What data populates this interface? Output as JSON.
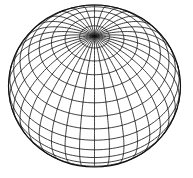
{
  "figure": {
    "type": "wireframe-sphere",
    "background": "#ffffff",
    "stroke_color": "#111111",
    "stroke_width": 0.8,
    "center": [
      94.5,
      86
    ],
    "radius_x": 86,
    "radius_y": 81,
    "tilt_deg": 52,
    "meridian_count": 36,
    "latitude_step_deg": 10
  }
}
